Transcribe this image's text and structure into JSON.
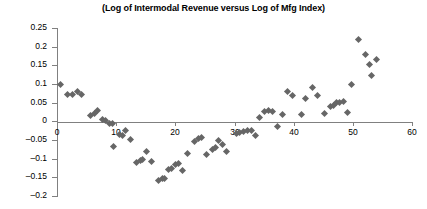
{
  "chart_data": {
    "type": "scatter",
    "title": "(Log of Intermodal Revenue versus Log of Mfg Index)",
    "xlabel": "",
    "ylabel": "",
    "xlim": [
      0,
      60
    ],
    "ylim": [
      -0.2,
      0.25
    ],
    "grid": false,
    "legend": null,
    "marker": {
      "shape": "diamond",
      "color": "#666666",
      "size": 5
    },
    "axis_color": "#808080",
    "xticks": [
      0,
      10,
      20,
      30,
      40,
      50,
      60
    ],
    "xtick_labels": [
      "0",
      "10",
      "20",
      "30",
      "40",
      "50",
      "60"
    ],
    "yticks": [
      0.25,
      0.2,
      0.15,
      0.1,
      0.05,
      0,
      -0.05,
      -0.1,
      -0.15,
      -0.2
    ],
    "ytick_labels": [
      "0.25",
      "0.2",
      "0.15",
      "0.1",
      "0.05",
      "0",
      "-0.05",
      "-0.1",
      "-0.15",
      "-0.2"
    ],
    "points": [
      {
        "x": 0.6,
        "y": 0.098
      },
      {
        "x": 1.8,
        "y": 0.071
      },
      {
        "x": 2.6,
        "y": 0.072
      },
      {
        "x": 3.4,
        "y": 0.079
      },
      {
        "x": 4.2,
        "y": 0.073
      },
      {
        "x": 5.6,
        "y": 0.016
      },
      {
        "x": 6.3,
        "y": 0.022
      },
      {
        "x": 6.9,
        "y": 0.028
      },
      {
        "x": 7.7,
        "y": 0.004
      },
      {
        "x": 8.2,
        "y": 0.002
      },
      {
        "x": 8.9,
        "y": -0.005
      },
      {
        "x": 9.3,
        "y": -0.007
      },
      {
        "x": 9.6,
        "y": -0.066
      },
      {
        "x": 10.6,
        "y": -0.035
      },
      {
        "x": 11.0,
        "y": -0.039
      },
      {
        "x": 11.6,
        "y": -0.024
      },
      {
        "x": 12.4,
        "y": -0.049
      },
      {
        "x": 13.4,
        "y": -0.11
      },
      {
        "x": 14.1,
        "y": -0.105
      },
      {
        "x": 14.5,
        "y": -0.103
      },
      {
        "x": 15.2,
        "y": -0.081
      },
      {
        "x": 16.0,
        "y": -0.108
      },
      {
        "x": 17.1,
        "y": -0.159
      },
      {
        "x": 17.8,
        "y": -0.153
      },
      {
        "x": 18.2,
        "y": -0.152
      },
      {
        "x": 18.9,
        "y": -0.13
      },
      {
        "x": 19.4,
        "y": -0.125
      },
      {
        "x": 20.1,
        "y": -0.116
      },
      {
        "x": 20.5,
        "y": -0.112
      },
      {
        "x": 21.2,
        "y": -0.131
      },
      {
        "x": 22.1,
        "y": -0.085
      },
      {
        "x": 23.2,
        "y": -0.053
      },
      {
        "x": 23.9,
        "y": -0.046
      },
      {
        "x": 24.4,
        "y": -0.044
      },
      {
        "x": 25.3,
        "y": -0.088
      },
      {
        "x": 26.2,
        "y": -0.076
      },
      {
        "x": 26.7,
        "y": -0.071
      },
      {
        "x": 27.3,
        "y": -0.05
      },
      {
        "x": 27.9,
        "y": -0.063
      },
      {
        "x": 28.6,
        "y": -0.08
      },
      {
        "x": 30.3,
        "y": -0.032
      },
      {
        "x": 30.9,
        "y": -0.03
      },
      {
        "x": 31.5,
        "y": -0.028
      },
      {
        "x": 32.2,
        "y": -0.024
      },
      {
        "x": 32.8,
        "y": -0.025
      },
      {
        "x": 33.6,
        "y": -0.039
      },
      {
        "x": 34.2,
        "y": 0.01
      },
      {
        "x": 35.1,
        "y": 0.026
      },
      {
        "x": 35.7,
        "y": 0.03
      },
      {
        "x": 36.4,
        "y": 0.027
      },
      {
        "x": 37.2,
        "y": -0.014
      },
      {
        "x": 38.1,
        "y": 0.018
      },
      {
        "x": 39.0,
        "y": 0.079
      },
      {
        "x": 39.8,
        "y": 0.07
      },
      {
        "x": 41.3,
        "y": 0.019
      },
      {
        "x": 42.0,
        "y": 0.061
      },
      {
        "x": 43.1,
        "y": 0.091
      },
      {
        "x": 44.0,
        "y": 0.07
      },
      {
        "x": 45.2,
        "y": 0.02
      },
      {
        "x": 46.2,
        "y": 0.039
      },
      {
        "x": 46.8,
        "y": 0.043
      },
      {
        "x": 47.3,
        "y": 0.05
      },
      {
        "x": 47.8,
        "y": 0.051
      },
      {
        "x": 48.4,
        "y": 0.052
      },
      {
        "x": 49.1,
        "y": 0.025
      },
      {
        "x": 49.8,
        "y": 0.099
      },
      {
        "x": 51.0,
        "y": 0.218
      },
      {
        "x": 52.1,
        "y": 0.178
      },
      {
        "x": 52.8,
        "y": 0.152
      },
      {
        "x": 53.2,
        "y": 0.122
      },
      {
        "x": 54.0,
        "y": 0.165
      }
    ]
  }
}
